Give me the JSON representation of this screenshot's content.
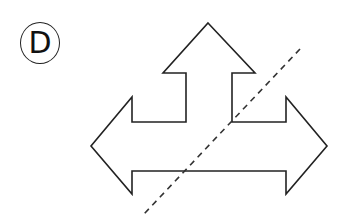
{
  "figure": {
    "label": "D",
    "shape": "three-way arrow (up, left, right)",
    "stroke_color": "#222222",
    "fill_color": "#ffffff",
    "symmetry_line": {
      "style": "dashed",
      "from": [
        300,
        49
      ],
      "to": [
        144,
        214
      ]
    }
  }
}
